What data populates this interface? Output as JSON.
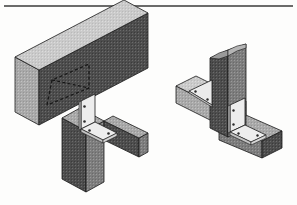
{
  "page": {
    "background_color": "#fdfdfc",
    "width": 297,
    "height": 205,
    "document_type": "patent-drawing-sheet",
    "caption": ""
  },
  "rule": {
    "name": "top-horizontal-rule",
    "color": "#3a3a3a",
    "x1": 4,
    "y1": 6,
    "x2": 293,
    "y2": 6,
    "thickness": 1.4
  },
  "palette": {
    "outline": "#1a1a1a",
    "face_dark": "#4d4d4d",
    "face_mid": "#7d7d7d",
    "face_light": "#a9a9a9",
    "face_pale": "#cfcfcf",
    "plate_face": "#ebebeb",
    "plate_edge": "#bdbdbd",
    "hole": "#2b2b2b",
    "hidden_line": "#1a1a1a",
    "background": "#fdfdfc"
  },
  "figures": [
    {
      "id": "figure-left",
      "name": "left-isometric-view",
      "label": "",
      "description": "Isometric view of a bracket connecting a horizontal header beam, a vertical post and a side beam",
      "parts": [
        {
          "name": "header-beam",
          "type": "beam",
          "orientation": "horizontal",
          "shading": "face_mid"
        },
        {
          "name": "vertical-post",
          "type": "post",
          "orientation": "vertical",
          "shading": "face_mid"
        },
        {
          "name": "side-beam",
          "type": "beam",
          "orientation": "horizontal",
          "shading": "face_light"
        },
        {
          "name": "angle-bracket",
          "type": "bracket",
          "plates": 2,
          "shading": "plate_face"
        },
        {
          "name": "hidden-gusset-outline",
          "type": "hidden-line-triangle",
          "style": "dashed"
        }
      ],
      "bolt_holes": 4
    },
    {
      "id": "figure-right",
      "name": "right-isometric-view",
      "label": "",
      "description": "Isometric view of a corner post with gusset bracket and angle bracket joining two beams",
      "parts": [
        {
          "name": "corner-post",
          "type": "post",
          "orientation": "vertical",
          "shading": "face_mid"
        },
        {
          "name": "left-beam",
          "type": "beam",
          "orientation": "horizontal",
          "shading": "face_pale"
        },
        {
          "name": "right-beam",
          "type": "beam",
          "orientation": "horizontal",
          "shading": "face_light"
        },
        {
          "name": "gusset-bracket",
          "type": "triangular-gusset",
          "shading": "plate_face"
        },
        {
          "name": "angle-bracket",
          "type": "bracket",
          "plates": 2,
          "shading": "plate_face"
        }
      ],
      "bolt_holes": 6
    }
  ]
}
